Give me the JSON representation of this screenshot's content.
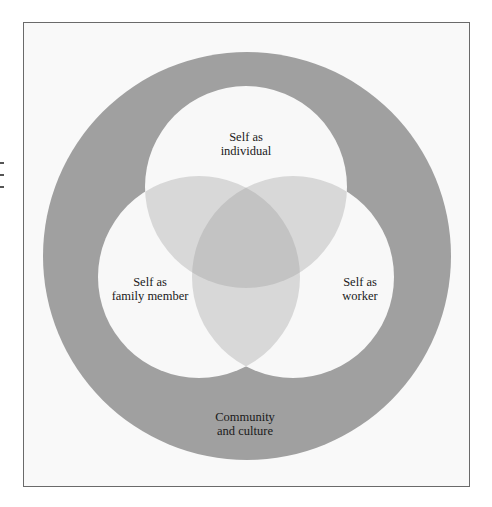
{
  "diagram": {
    "type": "nested-venn",
    "outer_ring": {
      "label_line1": "Community",
      "label_line2": "and culture",
      "color": "#9f9f9f"
    },
    "circles": [
      {
        "id": "individual",
        "label_line1": "Self as",
        "label_line2": "individual"
      },
      {
        "id": "family",
        "label_line1": "Self as",
        "label_line2": "family member"
      },
      {
        "id": "worker",
        "label_line1": "Self as",
        "label_line2": "worker"
      }
    ],
    "colors": {
      "background": "#f9f9f9",
      "circle_fill": "#f8f8f8",
      "pair_overlap": "#d6d6d6",
      "triple_overlap": "#c2c2c2",
      "frame_border": "#6a6a6a"
    }
  }
}
